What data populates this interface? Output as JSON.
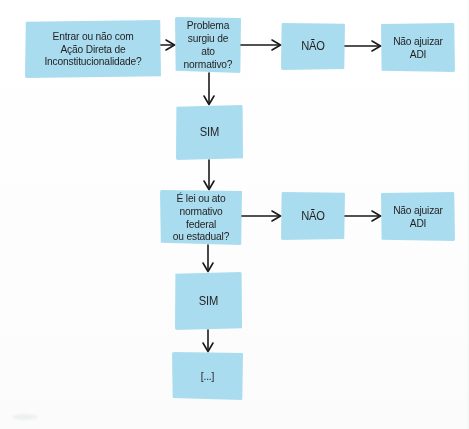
{
  "diagram": {
    "background_color": "#ffffff",
    "node_fill_color": "#a9dcee",
    "text_color": "#231f20",
    "arrow_color": "#1a1a1a",
    "nodes": [
      {
        "id": "start",
        "text": "Entrar ou não com Ação Direta de Inconstitucionalidade?",
        "lines": [
          "Entrar ou não com",
          "Ação Direta de",
          "Inconstitucionalidade?"
        ],
        "x": 25,
        "y": 20,
        "w": 136,
        "h": 58,
        "font_size": 11
      },
      {
        "id": "q1",
        "text": "Problema surgiu de ato normativo?",
        "lines": [
          "Problema",
          "surgiu de ato",
          "normativo?"
        ],
        "x": 175,
        "y": 17,
        "w": 66,
        "h": 56,
        "font_size": 11
      },
      {
        "id": "q1-no",
        "text": "NÃO",
        "lines": [
          "NÃO"
        ],
        "x": 281,
        "y": 23,
        "w": 64,
        "h": 47,
        "font_size": 12
      },
      {
        "id": "q1-no-result",
        "text": "Não ajuizar ADI",
        "lines": [
          "Não ajuizar",
          "ADI"
        ],
        "x": 381,
        "y": 23,
        "w": 74,
        "h": 49,
        "font_size": 11
      },
      {
        "id": "q1-yes",
        "text": "SIM",
        "lines": [
          "SIM"
        ],
        "x": 176,
        "y": 105,
        "w": 67,
        "h": 55,
        "font_size": 12
      },
      {
        "id": "q2",
        "text": "É lei ou ato normativo federal ou estadual?",
        "lines": [
          "É lei ou ato",
          "normativo federal",
          "ou estadual?"
        ],
        "x": 160,
        "y": 190,
        "w": 82,
        "h": 55,
        "font_size": 11
      },
      {
        "id": "q2-no",
        "text": "NÃO",
        "lines": [
          "NÃO"
        ],
        "x": 281,
        "y": 192,
        "w": 64,
        "h": 48,
        "font_size": 12
      },
      {
        "id": "q2-no-result",
        "text": "Não ajuizar ADI",
        "lines": [
          "Não ajuizar",
          "ADI"
        ],
        "x": 381,
        "y": 192,
        "w": 74,
        "h": 49,
        "font_size": 11
      },
      {
        "id": "q2-yes",
        "text": "SIM",
        "lines": [
          "SIM"
        ],
        "x": 175,
        "y": 272,
        "w": 67,
        "h": 58,
        "font_size": 12
      },
      {
        "id": "continuation",
        "text": "[...]",
        "lines": [
          "[...]"
        ],
        "x": 172,
        "y": 352,
        "w": 71,
        "h": 48,
        "font_size": 11
      }
    ],
    "arrows": [
      {
        "id": "start-to-q1",
        "from": "start",
        "to": "q1",
        "direction": "right",
        "x": 161,
        "y": 45,
        "length": 14
      },
      {
        "id": "q1-to-q1-no",
        "from": "q1",
        "to": "q1-no",
        "direction": "right",
        "x": 241,
        "y": 45,
        "length": 40
      },
      {
        "id": "q1-no-to-result",
        "from": "q1-no",
        "to": "q1-no-result",
        "direction": "right",
        "x": 345,
        "y": 46,
        "length": 36
      },
      {
        "id": "q1-to-q1-yes",
        "from": "q1",
        "to": "q1-yes",
        "direction": "down",
        "x": 209,
        "y": 73,
        "length": 32
      },
      {
        "id": "q1-yes-to-q2",
        "from": "q1-yes",
        "to": "q2",
        "direction": "down",
        "x": 209,
        "y": 160,
        "length": 30
      },
      {
        "id": "q2-to-q2-no",
        "from": "q2",
        "to": "q2-no",
        "direction": "right",
        "x": 242,
        "y": 216,
        "length": 39
      },
      {
        "id": "q2-no-to-result",
        "from": "q2-no",
        "to": "q2-no-result",
        "direction": "right",
        "x": 345,
        "y": 216,
        "length": 36
      },
      {
        "id": "q2-to-q2-yes",
        "from": "q2",
        "to": "q2-yes",
        "direction": "down",
        "x": 208,
        "y": 245,
        "length": 27
      },
      {
        "id": "q2-yes-to-continuation",
        "from": "q2-yes",
        "to": "continuation",
        "direction": "down",
        "x": 208,
        "y": 330,
        "length": 22
      }
    ]
  }
}
